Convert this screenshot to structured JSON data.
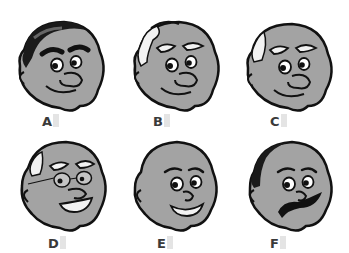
{
  "figure": {
    "colors": {
      "skin": "#a3a3a3",
      "outline": "#111111",
      "hair_white": "#f2f2f2",
      "hair_dark": "#1a1a1a",
      "label": "#3a3a3a"
    },
    "faces": [
      {
        "label": "A",
        "features": [
          "dark hair",
          "thick dark eyebrows",
          "big nose",
          "smile"
        ]
      },
      {
        "label": "B",
        "features": [
          "white hair tuft",
          "white eyebrows",
          "big nose",
          "smile"
        ]
      },
      {
        "label": "C",
        "features": [
          "white side hair",
          "white eyebrows",
          "big nose",
          "smile"
        ]
      },
      {
        "label": "D",
        "features": [
          "white side hair",
          "white eyebrows",
          "glasses",
          "toothy grin"
        ]
      },
      {
        "label": "E",
        "features": [
          "bald",
          "thin eyebrows",
          "open smile"
        ]
      },
      {
        "label": "F",
        "features": [
          "dark side hair",
          "thin eyebrows",
          "mustache"
        ]
      }
    ]
  }
}
